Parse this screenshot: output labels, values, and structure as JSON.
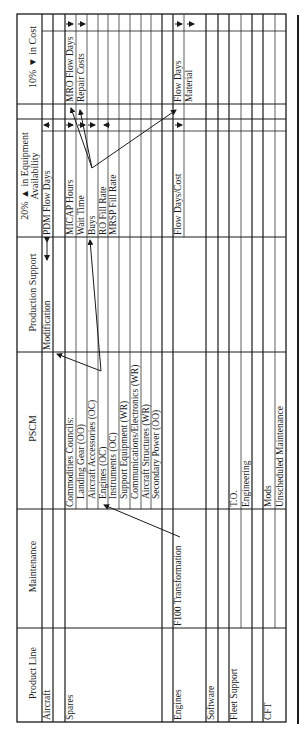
{
  "headers": {
    "product_line": "Product Line",
    "maintenance": "Maintenance",
    "pscm": "PSCM",
    "production_support": "Production Support",
    "equipment_availability_line1": "20% ▲ in Equipment",
    "equipment_availability_line2": "Availability",
    "cost": "10% ▼ in Cost"
  },
  "rows": {
    "aircraft": {
      "product_line": "Aircraft",
      "production_support": "Modification",
      "equipment_availability": "PDM Flow Days"
    },
    "spares": {
      "product_line": "Spares",
      "pscm_items": [
        "Commodities Councils:",
        "Landing Gear (OO)",
        "Aircraft Accessories (OC)",
        "Engines (OC)",
        "Instruments (OC)",
        "Support Equipment (WR)",
        "Communications/Electronics (WR)",
        "Aircraft Structures (WR)",
        "Secondary Power (OO)"
      ],
      "equipment_availability_items": [
        "MICAP Hours",
        "Wait Time",
        "Buys",
        "RO Fill Rate",
        "MRSP Fill Rate"
      ],
      "cost_items": [
        "MRO Flow Days",
        "Repair Costs"
      ]
    },
    "engines": {
      "product_line": "Engines",
      "maintenance": "F100 Transformation",
      "equipment_availability": "Flow Days/Cost",
      "cost_items": [
        "Flow Days",
        "Material"
      ]
    },
    "software": {
      "product_line": "Software"
    },
    "fleet_support": {
      "product_line": "Fleet Support",
      "pscm_items": [
        "T.O.",
        "Engineering"
      ]
    },
    "cft": {
      "product_line": "CFT",
      "pscm_items": [
        "Mods",
        "Unscheduled Maintenance"
      ]
    }
  },
  "colors": {
    "line": "#1a1a1a",
    "background": "#ffffff"
  }
}
